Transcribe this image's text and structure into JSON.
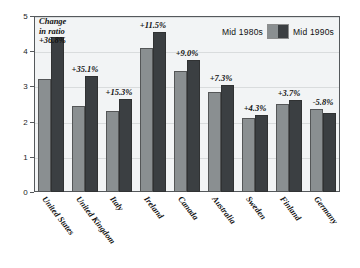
{
  "chart_data": {
    "type": "bar",
    "title": "",
    "subtitle": "",
    "xlabel": "",
    "ylabel": "",
    "ylim": [
      0,
      5
    ],
    "yticks": [
      0,
      1,
      2,
      3,
      4,
      5
    ],
    "ytick_labels": [
      "0",
      "1",
      "2",
      "3",
      "4",
      "5"
    ],
    "grid": true,
    "legend_position": "top-right",
    "categories": [
      "United States",
      "United Kingdom",
      "Italy",
      "Ireland",
      "Canada",
      "Australia",
      "Sweden",
      "Finland",
      "Germany"
    ],
    "series": [
      {
        "name": "Mid 1980s",
        "color": "#8a8f91",
        "values": [
          3.2,
          2.45,
          2.3,
          4.1,
          3.45,
          2.85,
          2.1,
          2.5,
          2.35
        ]
      },
      {
        "name": "Mid 1990s",
        "color": "#3b3f42",
        "values": [
          4.4,
          3.3,
          2.65,
          4.55,
          3.75,
          3.05,
          2.2,
          2.6,
          2.25
        ]
      }
    ],
    "annotations": [
      "+36.8%",
      "+35.1%",
      "+15.3%",
      "+11.5%",
      "+9.0%",
      "+7.3%",
      "+4.3%",
      "+3.7%",
      "-5.8%"
    ],
    "annotation_caption_lines": [
      "Change",
      "in ratio"
    ]
  },
  "legend": {
    "items": [
      {
        "label": "Mid 1980s",
        "color": "#8a8f91"
      },
      {
        "label": "Mid 1990s",
        "color": "#3b3f42"
      }
    ]
  },
  "colors": {
    "plot_background": "#f2f4f5",
    "axis": "#55595c",
    "gridline": "#d9dcdd",
    "series_1980s": "#8a8f91",
    "series_1990s": "#3b3f42",
    "text": "#111111"
  }
}
